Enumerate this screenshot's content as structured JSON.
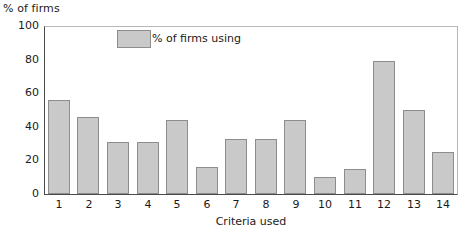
{
  "chart_data": {
    "type": "bar",
    "title": "",
    "ylabel": "% of firms",
    "xlabel": "Criteria used",
    "categories": [
      "1",
      "2",
      "3",
      "4",
      "5",
      "6",
      "7",
      "8",
      "9",
      "10",
      "11",
      "12",
      "13",
      "14"
    ],
    "values": [
      56,
      46,
      31,
      31,
      44,
      16,
      33,
      33,
      44,
      10,
      15,
      79,
      50,
      25
    ],
    "series": [
      {
        "name": "% of firms using",
        "values": [
          56,
          46,
          31,
          31,
          44,
          16,
          33,
          33,
          44,
          10,
          15,
          79,
          50,
          25
        ]
      }
    ],
    "ylim": [
      0,
      100
    ],
    "yticks": [
      0,
      20,
      40,
      60,
      80,
      100
    ],
    "ytick_labels": [
      "0",
      "20",
      "40",
      "60",
      "80",
      "100"
    ],
    "grid": false,
    "legend": {
      "position": "top-left-inside",
      "entries": [
        {
          "label": "% of firms using",
          "color": "#c9c9c9"
        }
      ]
    },
    "colors": {
      "bar_fill": "#c9c9c9",
      "bar_border": "#8d8d8d",
      "axis": "#4a4a4a",
      "frame": "#b8b8b8",
      "text": "#1a1a1a",
      "background": "#ffffff"
    }
  }
}
